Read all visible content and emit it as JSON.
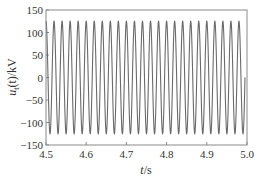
{
  "chart_data": {
    "type": "line",
    "title": "",
    "xlabel": "t/s",
    "xlabel_var": "t",
    "xlabel_unit": "/s",
    "ylabel": "u_t(t)/kV",
    "ylabel_var": "u",
    "ylabel_sub": "t",
    "ylabel_rest": "(t)/kV",
    "xlim": [
      4.5,
      5.0
    ],
    "ylim": [
      -150,
      150
    ],
    "xticks": [
      4.5,
      4.6,
      4.7,
      4.8,
      4.9,
      5.0
    ],
    "xtick_labels": [
      "4.5",
      "4.6",
      "4.7",
      "4.8",
      "4.9",
      "5.0"
    ],
    "yticks": [
      -150,
      -100,
      -50,
      0,
      50,
      100,
      150
    ],
    "ytick_labels": [
      "−150",
      "−100",
      "−50",
      "0",
      "50",
      "100",
      "150"
    ],
    "grid": false,
    "legend": null,
    "series": [
      {
        "name": "u_t(t)",
        "kind": "sinusoid",
        "amplitude_kV": 125,
        "frequency_Hz": 50,
        "phase_deg": 90,
        "t_start": 4.5,
        "t_end": 4.995,
        "color": "#6a6a6a"
      }
    ]
  }
}
